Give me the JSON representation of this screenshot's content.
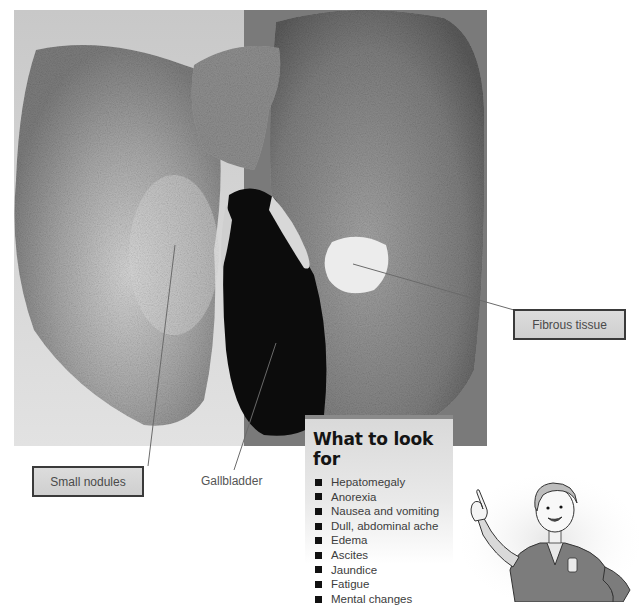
{
  "figure": {
    "photo_subject": "cirrhotic liver specimen with gallbladder",
    "labels": {
      "small_nodules": "Small nodules",
      "gallbladder": "Gallbladder",
      "fibrous_tissue": "Fibrous tissue"
    }
  },
  "look_for": {
    "title": "What to look for",
    "items": [
      "Hepatomegaly",
      "Anorexia",
      "Nausea and vomiting",
      "Dull, abdominal ache",
      "Edema",
      "Ascites",
      "Jaundice",
      "Fatigue",
      "Mental changes"
    ]
  },
  "illustration": {
    "subject": "cartoon nurse pointing up"
  },
  "colors": {
    "callout_fill": "#d4d4d4",
    "callout_border": "#3a3a3a",
    "leader_line": "#6a6a6a",
    "photo_dark": "#0c0c0c"
  }
}
